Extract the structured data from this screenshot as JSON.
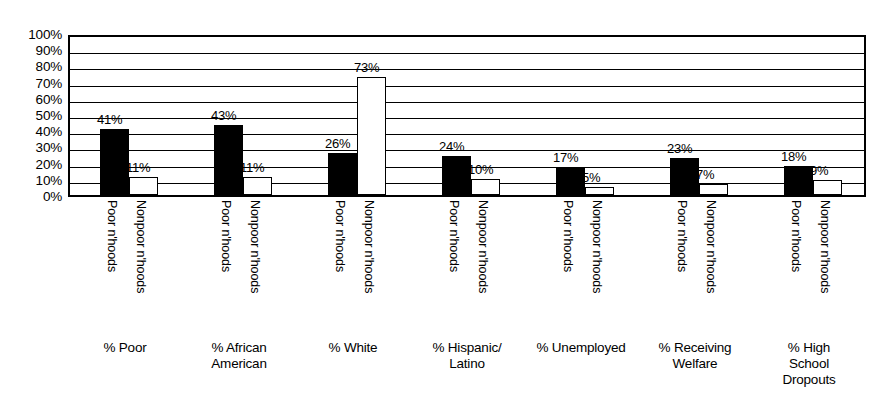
{
  "chart_data": {
    "type": "bar",
    "title": "",
    "subtitle": "",
    "xlabel": "",
    "ylabel": "",
    "ylim": [
      0,
      100
    ],
    "grid": true,
    "legend_position": "none",
    "y_ticks": [
      "100%",
      "90%",
      "80%",
      "70%",
      "60%",
      "50%",
      "40%",
      "30%",
      "20%",
      "10%",
      "0%"
    ],
    "y_tick_values": [
      100,
      90,
      80,
      70,
      60,
      50,
      40,
      30,
      20,
      10,
      0
    ],
    "categories": [
      "% Poor",
      "% African American",
      "% White",
      "% Hispanic/ Latino",
      "% Unemployed",
      "% Receiving Welfare",
      "% High School Dropouts"
    ],
    "category_label_lines": [
      [
        "% Poor"
      ],
      [
        "% African",
        "American"
      ],
      [
        "% White"
      ],
      [
        "% Hispanic/",
        "Latino"
      ],
      [
        "% Unemployed"
      ],
      [
        "% Receiving",
        "Welfare"
      ],
      [
        "% High",
        "School",
        "Dropouts"
      ]
    ],
    "series": [
      {
        "name": "Poor n'hoods",
        "fill": "#000000",
        "values": [
          41,
          43,
          26,
          24,
          17,
          23,
          18
        ],
        "value_labels": [
          "41%",
          "43%",
          "26%",
          "24%",
          "17%",
          "23%",
          "18%"
        ]
      },
      {
        "name": "Nonpoor n'hoods",
        "fill": "#ffffff",
        "values": [
          11,
          11,
          73,
          10,
          5,
          7,
          9
        ],
        "value_labels": [
          "11%",
          "11%",
          "73%",
          "10%",
          "5%",
          "7%",
          "9%"
        ]
      }
    ],
    "colors": {
      "axis": "#000000",
      "gridline": "#000000",
      "poor_bar": "#000000",
      "nonpoor_bar": "#ffffff",
      "background": "#ffffff",
      "text": "#000000"
    }
  }
}
